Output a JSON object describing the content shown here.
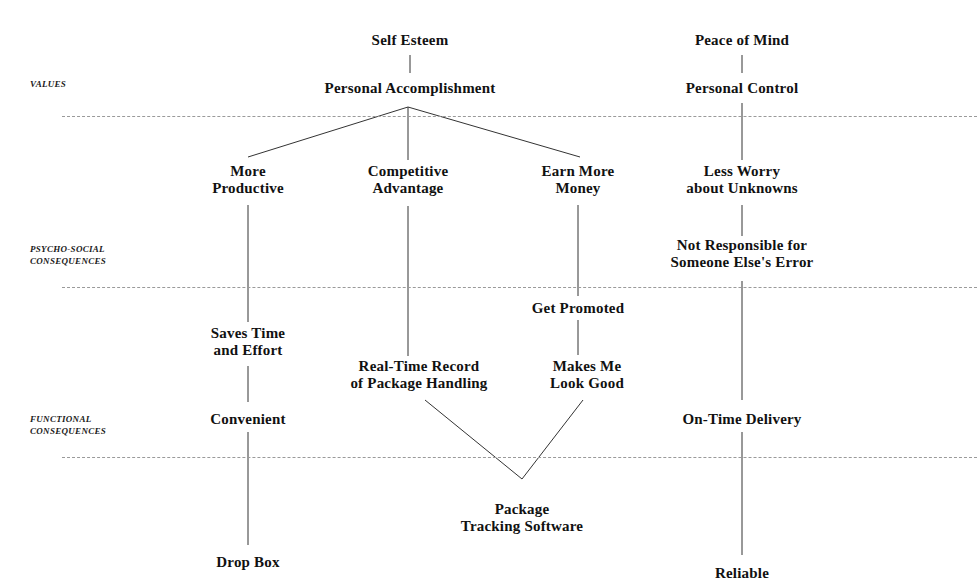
{
  "diagram": {
    "type": "means-end-chain",
    "width": 977,
    "height": 587,
    "background_color": "#ffffff",
    "line_color": "#333333",
    "text_color": "#111111"
  },
  "level_labels": [
    {
      "id": "values",
      "line1": "VALUES",
      "line2": "",
      "x": 30,
      "y": 78
    },
    {
      "id": "psycho-social",
      "line1": "PSYCHO-SOCIAL",
      "line2": "CONSEQUENCES",
      "x": 30,
      "y": 243
    },
    {
      "id": "functional",
      "line1": "FUNCTIONAL",
      "line2": "CONSEQUENCES",
      "x": 30,
      "y": 413
    }
  ],
  "dividers": [
    {
      "id": "values-divider",
      "y": 116,
      "x1": 62,
      "x2": 977
    },
    {
      "id": "psycho-social-divider",
      "y": 287,
      "x1": 62,
      "x2": 977
    },
    {
      "id": "functional-divider",
      "y": 457,
      "x1": 62,
      "x2": 977
    }
  ],
  "nodes": [
    {
      "id": "self-esteem",
      "line1": "Self Esteem",
      "line2": "",
      "x": 410,
      "y": 40
    },
    {
      "id": "peace-of-mind",
      "line1": "Peace of Mind",
      "line2": "",
      "x": 742,
      "y": 40
    },
    {
      "id": "personal-accomplishment",
      "line1": "Personal Accomplishment",
      "line2": "",
      "x": 410,
      "y": 88
    },
    {
      "id": "personal-control",
      "line1": "Personal Control",
      "line2": "",
      "x": 742,
      "y": 88
    },
    {
      "id": "more-productive",
      "line1": "More",
      "line2": "Productive",
      "x": 248,
      "y": 180
    },
    {
      "id": "competitive-advantage",
      "line1": "Competitive",
      "line2": "Advantage",
      "x": 408,
      "y": 180
    },
    {
      "id": "earn-more-money",
      "line1": "Earn More",
      "line2": "Money",
      "x": 578,
      "y": 180
    },
    {
      "id": "less-worry-about-unknowns",
      "line1": "Less Worry",
      "line2": "about Unknowns",
      "x": 742,
      "y": 180
    },
    {
      "id": "not-responsible-for-someone-elses-error",
      "line1": "Not Responsible for",
      "line2": "Someone Else's Error",
      "x": 742,
      "y": 254
    },
    {
      "id": "get-promoted",
      "line1": "Get Promoted",
      "line2": "",
      "x": 578,
      "y": 308
    },
    {
      "id": "saves-time-and-effort",
      "line1": "Saves Time",
      "line2": "and Effort",
      "x": 248,
      "y": 342
    },
    {
      "id": "real-time-record-of-package-handling",
      "line1": "Real-Time Record",
      "line2": "of Package Handling",
      "x": 419,
      "y": 375
    },
    {
      "id": "makes-me-look-good",
      "line1": "Makes Me",
      "line2": "Look Good",
      "x": 587,
      "y": 375
    },
    {
      "id": "convenient",
      "line1": "Convenient",
      "line2": "",
      "x": 248,
      "y": 419
    },
    {
      "id": "on-time-delivery",
      "line1": "On-Time Delivery",
      "line2": "",
      "x": 742,
      "y": 419
    },
    {
      "id": "package-tracking-software",
      "line1": "Package",
      "line2": "Tracking Software",
      "x": 522,
      "y": 518
    },
    {
      "id": "drop-box",
      "line1": "Drop Box",
      "line2": "",
      "x": 248,
      "y": 562
    },
    {
      "id": "reliable",
      "line1": "Reliable",
      "line2": "",
      "x": 742,
      "y": 573
    }
  ],
  "edges": [
    {
      "id": "self-esteem-to-personal-accomplishment",
      "points": "410,55 410,73"
    },
    {
      "id": "peace-of-mind-to-personal-control",
      "points": "742,55 742,73"
    },
    {
      "id": "personal-accomplishment-to-more-productive",
      "points": "408,107 248,157"
    },
    {
      "id": "personal-accomplishment-to-competitive-advantage",
      "points": "408,107 408,160"
    },
    {
      "id": "personal-accomplishment-to-earn-more-money",
      "points": "408,107 580,157"
    },
    {
      "id": "personal-control-to-less-worry",
      "points": "742,103 742,160"
    },
    {
      "id": "more-productive-to-saves-time",
      "points": "248,205 248,322"
    },
    {
      "id": "competitive-advantage-to-real-time-record",
      "points": "408,206 408,356"
    },
    {
      "id": "earn-more-money-to-get-promoted",
      "points": "578,205 578,296"
    },
    {
      "id": "less-worry-to-not-responsible",
      "points": "742,205 742,236"
    },
    {
      "id": "not-responsible-to-on-time-delivery",
      "points": "742,281 742,400"
    },
    {
      "id": "get-promoted-to-makes-me-look-good",
      "points": "578,320 578,355"
    },
    {
      "id": "saves-time-to-convenient",
      "points": "248,366 248,402"
    },
    {
      "id": "convenient-to-drop-box",
      "points": "248,432 248,545"
    },
    {
      "id": "real-time-record-to-package-tracking",
      "points": "425,400 522,479"
    },
    {
      "id": "makes-me-look-good-to-package-tracking",
      "points": "583,400 522,479"
    },
    {
      "id": "on-time-delivery-to-reliable",
      "points": "742,432 742,555"
    }
  ]
}
